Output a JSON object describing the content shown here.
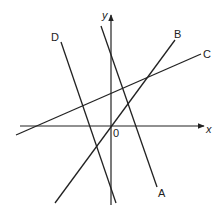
{
  "diagram": {
    "colors": {
      "stroke": "#222222",
      "background": "#ffffff"
    },
    "axes": {
      "x_label": "x",
      "y_label": "y",
      "origin_label": "0",
      "x_axis": {
        "x1": 20,
        "y1": 126,
        "x2": 204,
        "y2": 126
      },
      "y_axis": {
        "x1": 111,
        "y1": 205,
        "x2": 111,
        "y2": 15
      }
    },
    "lines": [
      {
        "id": "A",
        "label": "A",
        "x1": 101,
        "y1": 26,
        "x2": 157,
        "y2": 187,
        "label_x": 158,
        "label_y": 197,
        "slope_sign": "negative (steep)",
        "y_intercept_sign": "positive"
      },
      {
        "id": "B",
        "label": "B",
        "x1": 55,
        "y1": 203,
        "x2": 175,
        "y2": 40,
        "label_x": 174,
        "label_y": 38,
        "slope_sign": "positive",
        "y_intercept_sign": "zero (through origin)"
      },
      {
        "id": "C",
        "label": "C",
        "x1": 16,
        "y1": 135,
        "x2": 201,
        "y2": 54,
        "label_x": 203,
        "label_y": 58,
        "slope_sign": "positive (shallow)",
        "y_intercept_sign": "positive"
      },
      {
        "id": "D",
        "label": "D",
        "x1": 61,
        "y1": 42,
        "x2": 116,
        "y2": 203,
        "label_x": 51,
        "label_y": 41,
        "slope_sign": "negative (steep)",
        "y_intercept_sign": "negative"
      }
    ]
  }
}
